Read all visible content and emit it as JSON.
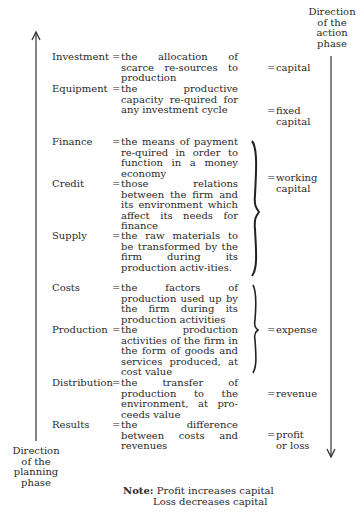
{
  "planning_direction": {
    "label_lines": [
      "Direction",
      "of the",
      "planning",
      "phase"
    ]
  },
  "action_direction": {
    "label_lines": [
      "Direction",
      "of the",
      "action",
      "phase"
    ]
  },
  "rows": [
    {
      "term": "Investment",
      "definition": "the allocation of scarce re-sources to production"
    },
    {
      "term": "Equipment",
      "definition": "the productive capacity re-quired for any investment cycle"
    },
    {
      "term": "Finance",
      "definition": "the means of payment re-quired in order to function in a money economy"
    },
    {
      "term": "Credit",
      "definition": "those relations between the firm and its environment which affect its needs for finance"
    },
    {
      "term": "Supply",
      "definition": "the raw materials to be transformed by the firm during its production activ-ities."
    },
    {
      "term": "Costs",
      "definition": "the factors of production used up by the firm during its production activities"
    },
    {
      "term": "Production",
      "definition": "the production activities of the firm in the form of goods and services produced, at cost value"
    },
    {
      "term": "Distribution",
      "definition": "the transfer of production to the environment, at pro-ceeds value"
    },
    {
      "term": "Results",
      "definition": "the difference between costs and revenues"
    }
  ],
  "equals_sign": "=",
  "outcomes": [
    {
      "label": "capital"
    },
    {
      "label_lines": [
        "fixed",
        "capital"
      ]
    },
    {
      "label_lines": [
        "working",
        "capital"
      ]
    },
    {
      "label": "expense"
    },
    {
      "label": "revenue"
    },
    {
      "label_lines": [
        "profit",
        "or loss"
      ]
    }
  ],
  "note": {
    "prefix": "Note:",
    "line1": "Profit increases capital",
    "line2": "Loss decreases capital"
  }
}
